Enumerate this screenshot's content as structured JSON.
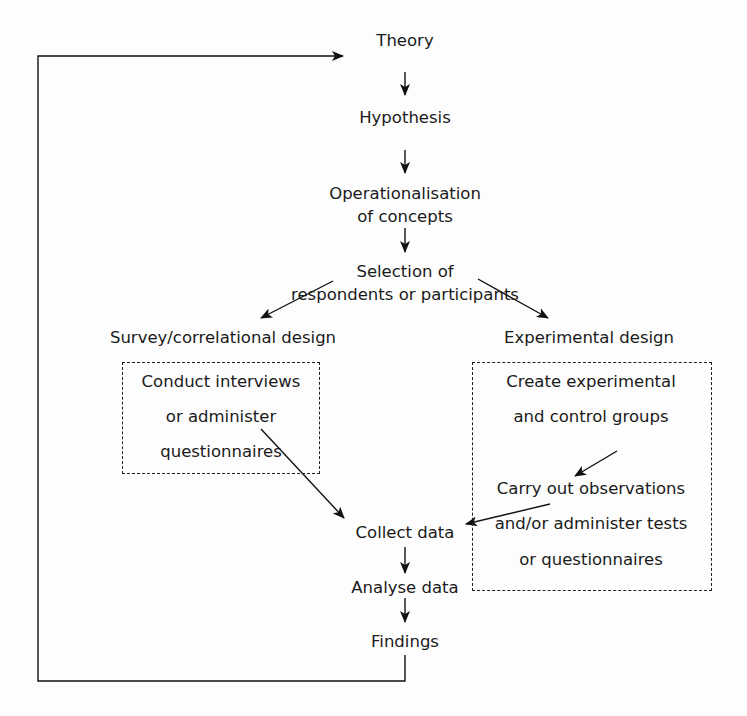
{
  "diagram": {
    "type": "flowchart",
    "nodes": {
      "theory": "Theory",
      "hypothesis": "Hypothesis",
      "operationalisation_1": "Operationalisation",
      "operationalisation_2": "of concepts",
      "selection_1": "Selection of",
      "selection_2": "respondents or participants",
      "survey_design": "Survey/correlational design",
      "experimental_design": "Experimental design",
      "survey_box_1": "Conduct interviews",
      "survey_box_2": "or administer",
      "survey_box_3": "questionnaires",
      "exp_box_1": "Create experimental",
      "exp_box_2": "and control groups",
      "exp_box_3": "Carry out observations",
      "exp_box_4": "and/or administer tests",
      "exp_box_5": "or questionnaires",
      "collect": "Collect data",
      "analyse": "Analyse data",
      "findings": "Findings"
    },
    "edges": [
      [
        "Theory",
        "Hypothesis"
      ],
      [
        "Hypothesis",
        "Operationalisation of concepts"
      ],
      [
        "Operationalisation of concepts",
        "Selection of respondents or participants"
      ],
      [
        "Selection of respondents or participants",
        "Survey/correlational design"
      ],
      [
        "Selection of respondents or participants",
        "Experimental design"
      ],
      [
        "Create experimental and control groups",
        "Carry out observations and/or administer tests or questionnaires"
      ],
      [
        "Conduct interviews or administer questionnaires",
        "Collect data"
      ],
      [
        "Experimental design box",
        "Collect data"
      ],
      [
        "Collect data",
        "Analyse data"
      ],
      [
        "Analyse data",
        "Findings"
      ],
      [
        "Findings",
        "Theory"
      ]
    ]
  }
}
